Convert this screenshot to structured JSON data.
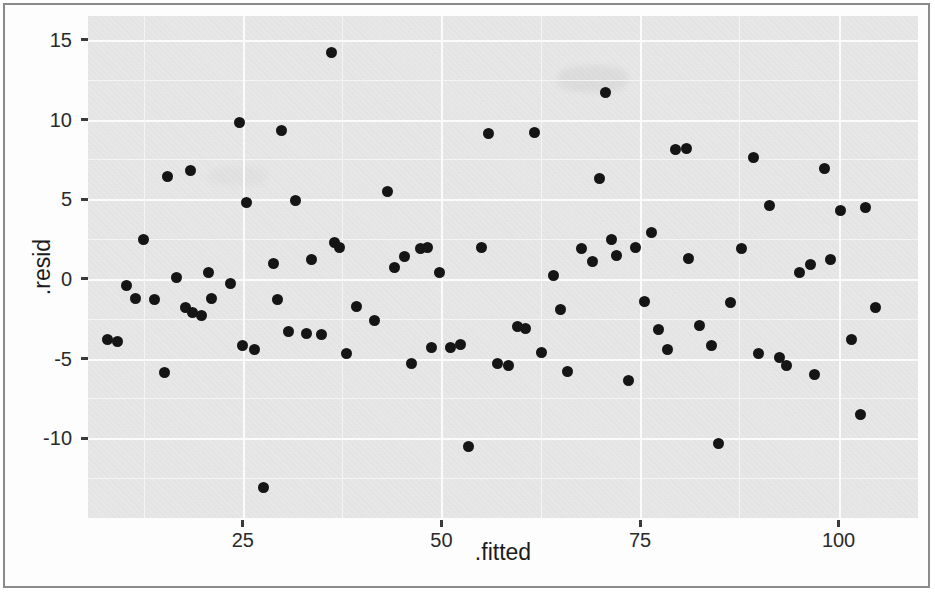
{
  "figure": {
    "background_color": "#ffffff",
    "panel_color": "#e9e9e9",
    "gridline_color": "#fbfbfb",
    "point_color": "#151515",
    "frame_color": "#8a8a8a"
  },
  "axes": {
    "y_title": ".resid",
    "x_title": ".fitted",
    "y_ticks": [
      "15",
      "10",
      "5",
      "0",
      "-5",
      "-10"
    ],
    "x_ticks": [
      "25",
      "50",
      "75",
      "100"
    ]
  },
  "chart_data": {
    "type": "scatter",
    "title": "",
    "xlabel": ".fitted",
    "ylabel": ".resid",
    "xlim": [
      5.5,
      110
    ],
    "ylim": [
      -15,
      16.5
    ],
    "xticks": [
      25,
      50,
      75,
      100
    ],
    "yticks": [
      -10,
      -5,
      0,
      5,
      10,
      15
    ],
    "grid": true,
    "legend": "none",
    "marker": {
      "shape": "circle",
      "size": 11,
      "color": "#151515"
    },
    "n_points": 92,
    "points": [
      {
        "x": 8.0,
        "y": -3.8
      },
      {
        "x": 9.2,
        "y": -3.9
      },
      {
        "x": 10.3,
        "y": -0.4
      },
      {
        "x": 11.5,
        "y": -1.2
      },
      {
        "x": 12.5,
        "y": 2.5
      },
      {
        "x": 13.9,
        "y": -1.3
      },
      {
        "x": 15.1,
        "y": -5.9
      },
      {
        "x": 15.5,
        "y": 6.4
      },
      {
        "x": 16.6,
        "y": 0.1
      },
      {
        "x": 17.8,
        "y": -1.8
      },
      {
        "x": 18.4,
        "y": 6.8
      },
      {
        "x": 18.6,
        "y": -2.1
      },
      {
        "x": 19.8,
        "y": -2.3
      },
      {
        "x": 20.7,
        "y": 0.4
      },
      {
        "x": 21.1,
        "y": -1.2
      },
      {
        "x": 23.5,
        "y": -0.3
      },
      {
        "x": 24.6,
        "y": 9.8
      },
      {
        "x": 24.9,
        "y": -4.2
      },
      {
        "x": 25.5,
        "y": 4.8
      },
      {
        "x": 26.5,
        "y": -4.4
      },
      {
        "x": 27.6,
        "y": -13.1
      },
      {
        "x": 28.9,
        "y": 1.0
      },
      {
        "x": 29.3,
        "y": -1.3
      },
      {
        "x": 29.9,
        "y": 9.3
      },
      {
        "x": 30.8,
        "y": -3.3
      },
      {
        "x": 31.6,
        "y": 4.9
      },
      {
        "x": 33.0,
        "y": -3.4
      },
      {
        "x": 33.6,
        "y": 1.2
      },
      {
        "x": 34.9,
        "y": -3.5
      },
      {
        "x": 36.1,
        "y": 14.2
      },
      {
        "x": 36.5,
        "y": 2.3
      },
      {
        "x": 37.2,
        "y": 2.0
      },
      {
        "x": 38.1,
        "y": -4.7
      },
      {
        "x": 39.3,
        "y": -1.7
      },
      {
        "x": 41.6,
        "y": -2.6
      },
      {
        "x": 43.2,
        "y": 5.5
      },
      {
        "x": 44.1,
        "y": 0.7
      },
      {
        "x": 45.4,
        "y": 1.4
      },
      {
        "x": 46.2,
        "y": -5.3
      },
      {
        "x": 47.4,
        "y": 1.9
      },
      {
        "x": 48.2,
        "y": 2.0
      },
      {
        "x": 48.8,
        "y": -4.3
      },
      {
        "x": 49.8,
        "y": 0.4
      },
      {
        "x": 51.1,
        "y": -4.3
      },
      {
        "x": 52.4,
        "y": -4.1
      },
      {
        "x": 53.4,
        "y": -10.5
      },
      {
        "x": 55.0,
        "y": 2.0
      },
      {
        "x": 55.9,
        "y": 9.1
      },
      {
        "x": 57.0,
        "y": -5.3
      },
      {
        "x": 58.4,
        "y": -5.4
      },
      {
        "x": 59.6,
        "y": -3.0
      },
      {
        "x": 60.6,
        "y": -3.1
      },
      {
        "x": 61.7,
        "y": 9.2
      },
      {
        "x": 62.6,
        "y": -4.6
      },
      {
        "x": 64.1,
        "y": 0.2
      },
      {
        "x": 65.0,
        "y": -1.9
      },
      {
        "x": 65.9,
        "y": -5.8
      },
      {
        "x": 67.6,
        "y": 1.9
      },
      {
        "x": 69.0,
        "y": 1.1
      },
      {
        "x": 69.9,
        "y": 6.3
      },
      {
        "x": 70.6,
        "y": 11.7
      },
      {
        "x": 71.4,
        "y": 2.5
      },
      {
        "x": 72.1,
        "y": 1.5
      },
      {
        "x": 73.5,
        "y": -6.4
      },
      {
        "x": 74.4,
        "y": 2.0
      },
      {
        "x": 75.6,
        "y": -1.4
      },
      {
        "x": 76.4,
        "y": 2.9
      },
      {
        "x": 77.3,
        "y": -3.2
      },
      {
        "x": 78.4,
        "y": -4.4
      },
      {
        "x": 79.5,
        "y": 8.1
      },
      {
        "x": 80.8,
        "y": 8.2
      },
      {
        "x": 81.1,
        "y": 1.3
      },
      {
        "x": 82.5,
        "y": -2.9
      },
      {
        "x": 84.0,
        "y": -4.2
      },
      {
        "x": 84.9,
        "y": -10.3
      },
      {
        "x": 86.4,
        "y": -1.5
      },
      {
        "x": 87.8,
        "y": 1.9
      },
      {
        "x": 89.3,
        "y": 7.6
      },
      {
        "x": 89.9,
        "y": -4.7
      },
      {
        "x": 91.3,
        "y": 4.6
      },
      {
        "x": 92.6,
        "y": -4.9
      },
      {
        "x": 93.5,
        "y": -5.4
      },
      {
        "x": 95.1,
        "y": 0.4
      },
      {
        "x": 96.5,
        "y": 0.9
      },
      {
        "x": 97.0,
        "y": -6.0
      },
      {
        "x": 98.2,
        "y": 6.9
      },
      {
        "x": 99.0,
        "y": 1.2
      },
      {
        "x": 100.2,
        "y": 4.3
      },
      {
        "x": 101.6,
        "y": -3.8
      },
      {
        "x": 102.8,
        "y": -8.5
      },
      {
        "x": 103.4,
        "y": 4.5
      },
      {
        "x": 104.6,
        "y": -1.8
      }
    ]
  }
}
